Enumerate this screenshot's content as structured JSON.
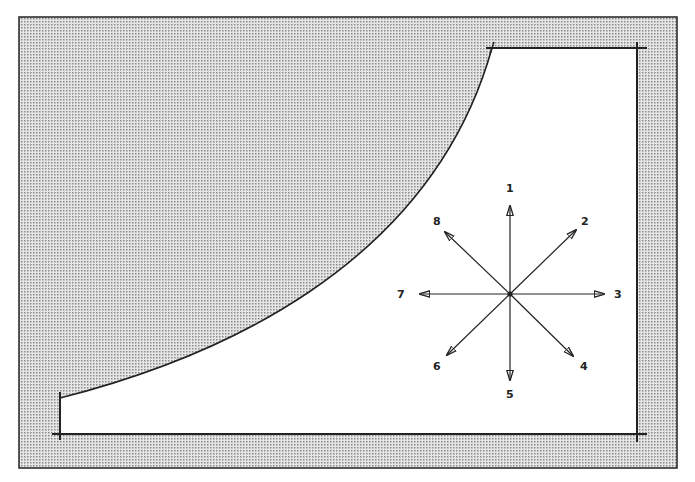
{
  "diagram": {
    "colors": {
      "shade": "#c9c9c9",
      "line": "#222222",
      "background": "#ffffff"
    },
    "compass": {
      "center": [
        510,
        294
      ],
      "directions": [
        {
          "label": "1",
          "angle": "up"
        },
        {
          "label": "2",
          "angle": "up-right"
        },
        {
          "label": "3",
          "angle": "right"
        },
        {
          "label": "4",
          "angle": "down-right"
        },
        {
          "label": "5",
          "angle": "down"
        },
        {
          "label": "6",
          "angle": "down-left"
        },
        {
          "label": "7",
          "angle": "left"
        },
        {
          "label": "8",
          "angle": "up-left"
        }
      ]
    }
  }
}
